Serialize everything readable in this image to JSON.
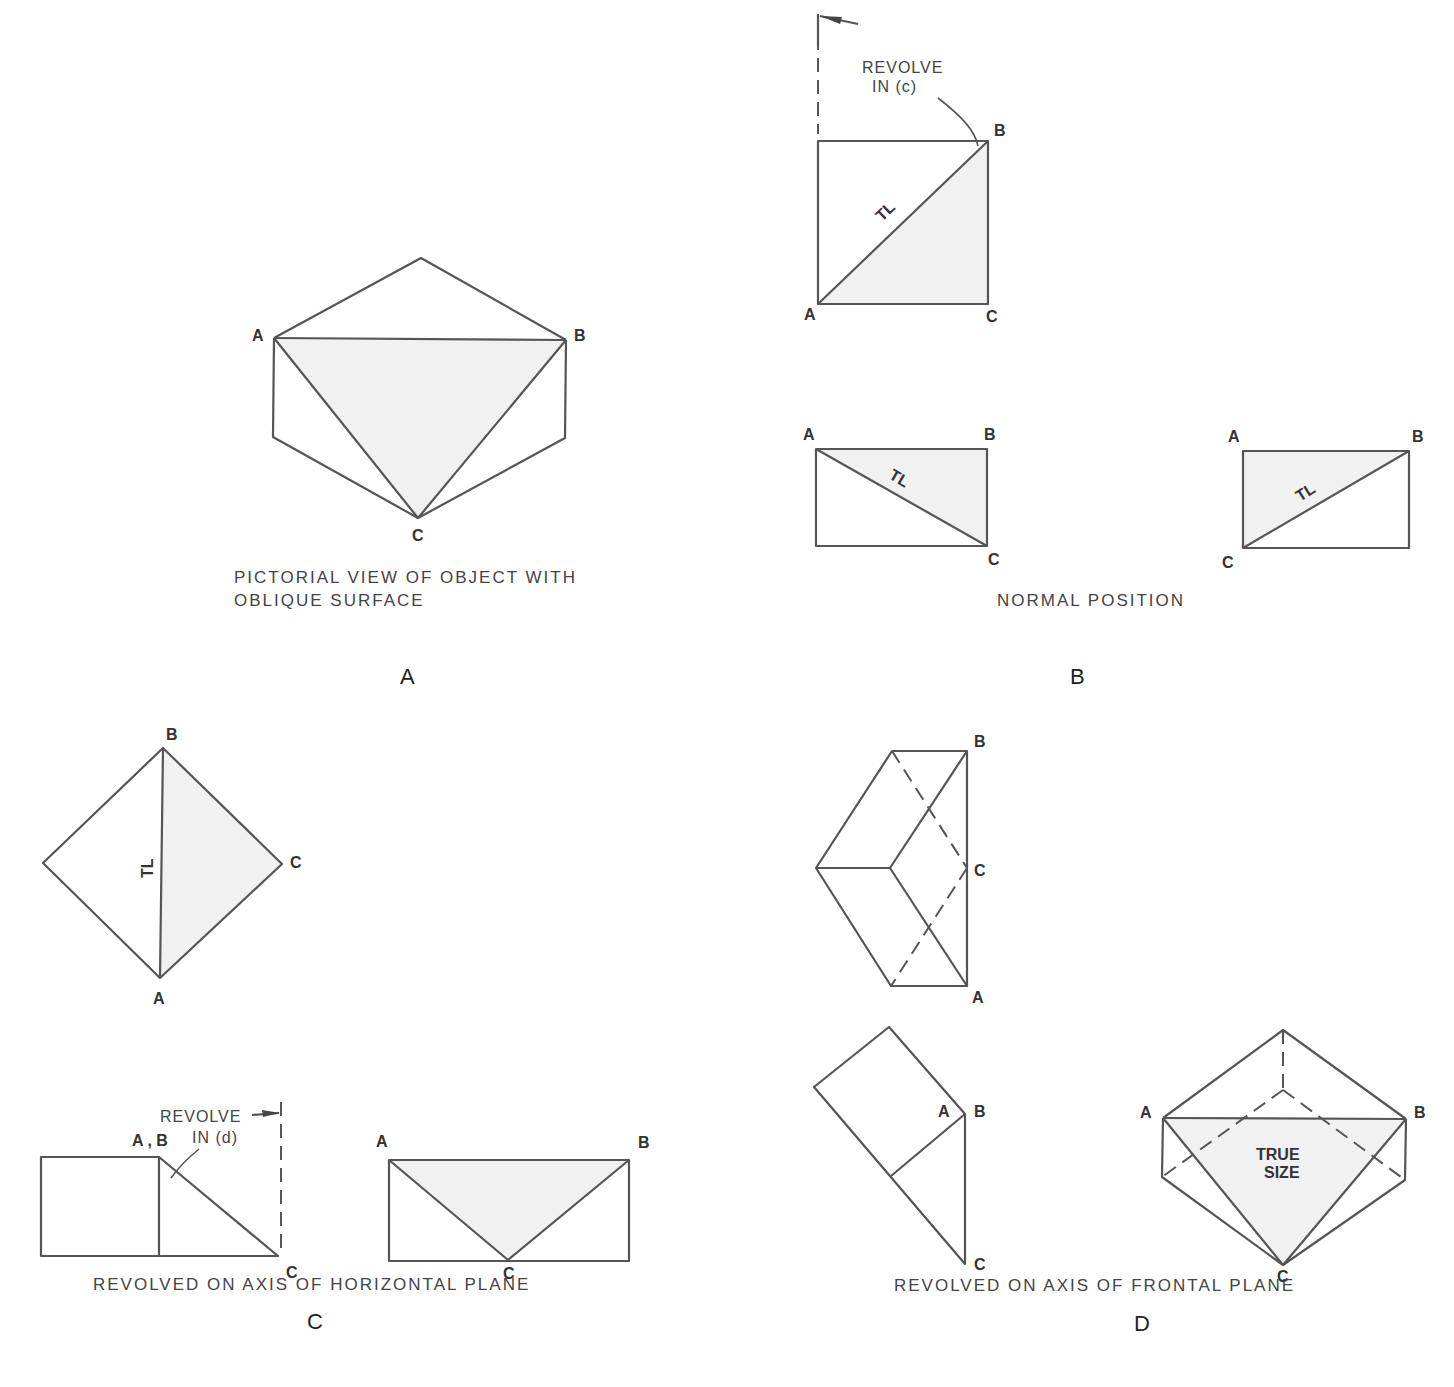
{
  "panels": {
    "A": {
      "letter": "A",
      "caption_line1": "PICTORIAL VIEW OF OBJECT WITH",
      "caption_line2": "OBLIQUE SURFACE",
      "points": {
        "a": "A",
        "b": "B",
        "c": "C"
      }
    },
    "B": {
      "letter": "B",
      "caption": "NORMAL POSITION",
      "revolve_note_line1": "REVOLVE",
      "revolve_note_line2": "IN (c)",
      "tl_label": "TL",
      "points": {
        "a": "A",
        "b": "B",
        "c": "C"
      }
    },
    "C": {
      "letter": "C",
      "caption": "REVOLVED ON AXIS OF HORIZONTAL PLANE",
      "revolve_note_line1": "REVOLVE",
      "revolve_note_line2": "IN (d)",
      "tl_label": "TL",
      "points": {
        "a": "A",
        "b": "B",
        "c": "C",
        "ab": "A , B"
      }
    },
    "D": {
      "letter": "D",
      "caption": "REVOLVED ON AXIS OF FRONTAL PLANE",
      "true_size_line1": "TRUE",
      "true_size_line2": "SIZE",
      "points": {
        "a": "A",
        "b": "B",
        "c": "C"
      }
    }
  },
  "colors": {
    "line": "#555555",
    "fill": "#f1f1f1",
    "text": "#333333"
  }
}
